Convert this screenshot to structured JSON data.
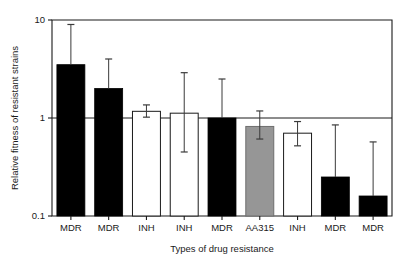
{
  "chart_data": {
    "type": "bar",
    "title": "",
    "xlabel": "Types of drug resistance",
    "ylabel": "Relative fitness of resistant strains",
    "yscale": "log",
    "ylim": [
      0.1,
      10
    ],
    "ytick_labels": [
      "10",
      "1",
      "0.1"
    ],
    "ytick_values": [
      10,
      1,
      0.1
    ],
    "grid": false,
    "legend": "none",
    "reference_line": 1.0,
    "categories": [
      "MDR",
      "MDR",
      "INH",
      "INH",
      "MDR",
      "AA315",
      "INH",
      "MDR",
      "MDR"
    ],
    "values": [
      3.5,
      2.0,
      1.17,
      1.12,
      1.0,
      0.82,
      0.7,
      0.25,
      0.16
    ],
    "error_low": [
      3.5,
      2.0,
      1.02,
      0.45,
      1.0,
      0.61,
      0.52,
      0.25,
      0.16
    ],
    "error_high": [
      9.0,
      4.0,
      1.36,
      2.9,
      2.5,
      1.18,
      0.92,
      0.85,
      0.57
    ],
    "fill_styles": [
      "black",
      "black",
      "white",
      "white",
      "black",
      "gray",
      "white",
      "black",
      "black"
    ],
    "colors": {
      "black": "#000000",
      "white": "#ffffff",
      "gray": "#969696",
      "outline": "#1a1a1a",
      "error": "#3a3a3a"
    }
  }
}
